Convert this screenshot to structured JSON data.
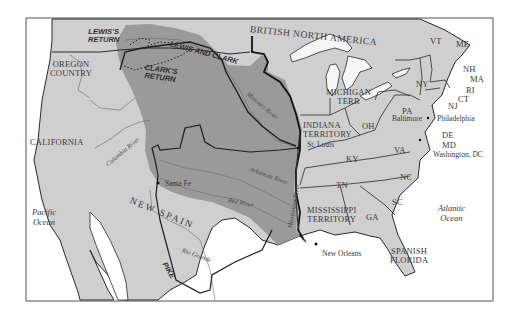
{
  "map": {
    "title_region": "BRITISH NORTH AMERICA",
    "colors": {
      "land": "#cfcfcf",
      "purchase": "#9a9a9a",
      "water": "#ffffff",
      "lakes": "#f6f6f6",
      "border": "#1e1e1e",
      "frame": "#555555"
    },
    "regions": {
      "british_north_america": "BRITISH NORTH AMERICA",
      "oregon_country": "OREGON\nCOUNTRY",
      "california": "CALIFORNIA",
      "new_spain": "NEW SPAIN",
      "indiana_territory": "INDIANA\nTERRITORY",
      "michigan_terr": "MICHIGAN\nTERR",
      "mississippi_territory": "MISSISSIPPI\nTERRITORY",
      "spanish_florida": "SPANISH\nFLORIDA"
    },
    "states": [
      "VT",
      "ME",
      "NH",
      "MA",
      "RI",
      "CT",
      "NJ",
      "NY",
      "PA",
      "OH",
      "KY",
      "VA",
      "DE",
      "MD",
      "TN",
      "NC",
      "SC",
      "GA"
    ],
    "cities": {
      "philadelphia": "Philadelphia",
      "baltimore": "Baltimore",
      "washington": "Washington, DC",
      "st_louis": "St. Louis",
      "santa_fe": "Santa Fe",
      "new_orleans": "New Orleans"
    },
    "rivers": {
      "missouri": "Missouri River",
      "mississippi": "Mississippi River",
      "arkansas": "Arkansas River",
      "red": "Red River",
      "columbia": "Colombia River",
      "rio_grande": "Rio Grande"
    },
    "oceans": {
      "pacific": "Pacific\nOcean",
      "atlantic": "Atlantic\nOcean"
    },
    "routes": {
      "lewis_and_clark": "LEWIS AND CLARK",
      "lewis_return": "LEWIS'S\nRETURN",
      "clark_return": "CLARK'S\nRETURN",
      "pike": "PIKE"
    }
  }
}
